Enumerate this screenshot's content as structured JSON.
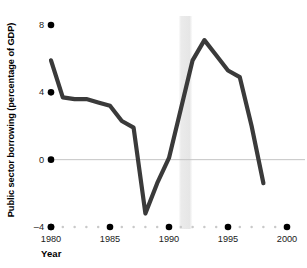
{
  "chart_data": {
    "type": "line",
    "title": "",
    "xlabel": "Year",
    "ylabel": "Public sector borrowing (percentage of GDP)",
    "xlim": [
      1980,
      2000
    ],
    "ylim": [
      -4,
      8
    ],
    "xticks": [
      1980,
      1985,
      1990,
      1995,
      2000
    ],
    "xticklabels": [
      "1980",
      "1985",
      "1990",
      "1995",
      "2000"
    ],
    "yticks": [
      -4,
      0,
      4,
      8
    ],
    "yticklabels": [
      "–4",
      "0",
      "4",
      "8"
    ],
    "grid": false,
    "legend": null,
    "zero_line": true,
    "minor_xticks_every": 1,
    "shaded_band": {
      "label": "",
      "x_start": 1990.8,
      "x_end": 1992.0,
      "color": "#e8e8e8"
    },
    "series": [
      {
        "name": "Public sector borrowing",
        "color": "#3a3a3a",
        "line_width": 4.2,
        "x": [
          1980,
          1981,
          1982,
          1983,
          1984,
          1985,
          1986,
          1987,
          1988,
          1989,
          1990,
          1991,
          1992,
          1993,
          1994,
          1995,
          1996,
          1997,
          1998
        ],
        "values": [
          5.9,
          3.7,
          3.6,
          3.6,
          3.4,
          3.2,
          2.3,
          1.9,
          -3.2,
          -1.4,
          0.1,
          3.0,
          5.9,
          7.1,
          6.2,
          5.3,
          4.9,
          2.0,
          -1.4
        ]
      }
    ]
  },
  "axis": {
    "y_title": "Public sector borrowing (percentage of GDP)",
    "x_title": "Year"
  },
  "colors": {
    "line": "#3a3a3a",
    "tick_dot": "#000000",
    "minor_dot": "#c9c9c9",
    "zero_line": "#c4c4c4",
    "band": "#e9e9e9",
    "text": "#111111"
  }
}
